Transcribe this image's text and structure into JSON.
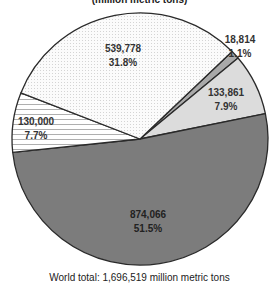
{
  "chart_data": {
    "type": "pie",
    "title": "(million metric tons)",
    "slices": [
      {
        "label": "18,814",
        "value": 18814,
        "percent": "1.1%",
        "color": "#a9a9a9",
        "pattern": "solid-medium-gray"
      },
      {
        "label": "133,861",
        "value": 133861,
        "percent": "7.9%",
        "color": "#dcdcdc",
        "pattern": "solid-light-gray"
      },
      {
        "label": "874,066",
        "value": 874066,
        "percent": "51.5%",
        "color": "#7c7c7c",
        "pattern": "solid-dark-gray"
      },
      {
        "label": "130,000",
        "value": 130000,
        "percent": "7.7%",
        "color": "#ffffff",
        "pattern": "horizontal-lines"
      },
      {
        "label": "539,778",
        "value": 539778,
        "percent": "31.8%",
        "color": "#f4f4f4",
        "pattern": "stipple-dots"
      }
    ],
    "start_bearing_deg": 46,
    "direction": "clockwise",
    "total_label": "World total:  1,696,519 million metric tons",
    "total": 1696519,
    "unit": "million metric tons"
  },
  "labels": {
    "s0": {
      "value": "18,814",
      "percent": "1.1%"
    },
    "s1": {
      "value": "133,861",
      "percent": "7.9%"
    },
    "s2": {
      "value": "874,066",
      "percent": "51.5%"
    },
    "s3": {
      "value": "130,000",
      "percent": "7.7%"
    },
    "s4": {
      "value": "539,778",
      "percent": "31.8%"
    }
  },
  "title": "(million metric tons)",
  "footer": "World total:  1,696,519 million metric tons"
}
